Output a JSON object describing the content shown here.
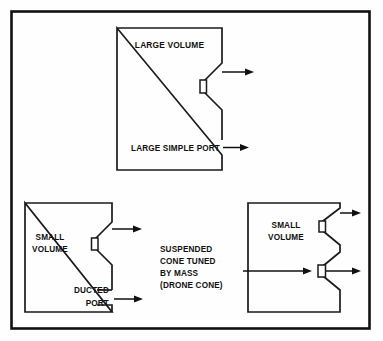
{
  "figure": {
    "border_color": "#111111",
    "line_color": "#1a1a1a",
    "background": "#ffffff"
  },
  "diagrams": [
    {
      "id": "large-simple-port",
      "position": "top-center",
      "labels": {
        "volume": "LARGE VOLUME",
        "port": "LARGE SIMPLE PORT"
      },
      "driver": "cone with voice coil",
      "arrows": 2
    },
    {
      "id": "ducted-port",
      "position": "bottom-left",
      "labels": {
        "volume_line1": "SMALL",
        "volume_line2": "VOLUME",
        "port_line1": "DUCTED",
        "port_line2": "PORT"
      },
      "driver": "cone with voice coil",
      "arrows": 2
    },
    {
      "id": "drone-cone",
      "position": "bottom-right",
      "labels": {
        "volume_line1": "SMALL",
        "volume_line2": "VOLUME",
        "annotation_line1": "SUSPENDED",
        "annotation_line2": "CONE TUNED",
        "annotation_line3": "BY MASS",
        "annotation_line4": "(DRONE CONE)"
      },
      "driver": "cone with voice coil",
      "passive_radiator": "suspended drone cone tuned by mass",
      "arrows": 3
    }
  ],
  "annotations": {
    "large_volume": "LARGE VOLUME",
    "large_simple_port": "LARGE SIMPLE PORT",
    "small_volume_left_l1": "SMALL",
    "small_volume_left_l2": "VOLUME",
    "ducted": "DUCTED",
    "port": "PORT",
    "suspended": "SUSPENDED",
    "cone_tuned": "CONE TUNED",
    "by_mass": "BY MASS",
    "drone_cone": "(DRONE CONE)",
    "small_volume_right_l1": "SMALL",
    "small_volume_right_l2": "VOLUME"
  }
}
